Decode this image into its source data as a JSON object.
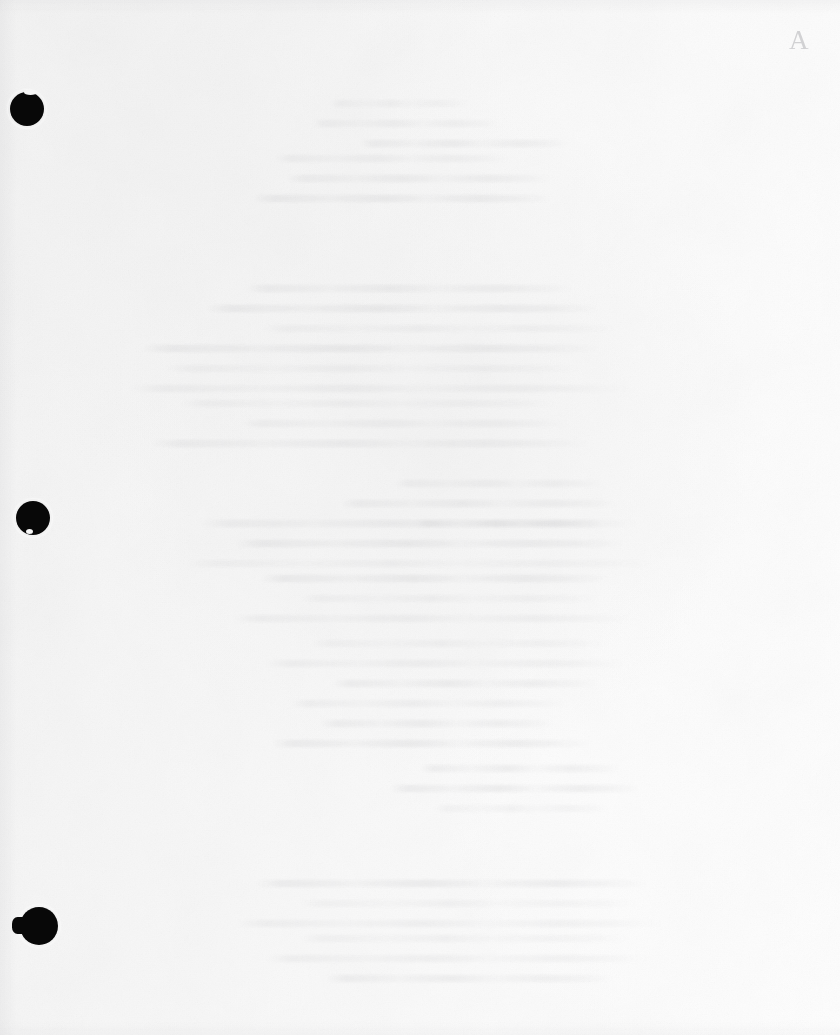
{
  "document": {
    "page_kind": "blank-scanned-page",
    "visible_text": "",
    "annotation": {
      "mark": "A",
      "description": "faint handwritten pencil mark, upper right corner"
    },
    "paper": {
      "background_color": "#f8f8f8",
      "tone_light": "#fefefe",
      "tone_mid": "#f8f8f8",
      "tone_dark": "#f3f3f3",
      "ink_color": "#080808"
    },
    "binding": {
      "description": "three-hole punch along left margin",
      "holes": [
        {
          "name": "top-punch-hole",
          "cx": 27,
          "cy": 109,
          "r": 17
        },
        {
          "name": "middle-punch-hole",
          "cx": 33,
          "cy": 518,
          "r": 17
        },
        {
          "name": "bottom-punch-hole",
          "cx": 39,
          "cy": 926,
          "r": 19
        }
      ]
    },
    "show_through": {
      "description": "faint ghost text bleeding through from the reverse side",
      "opacity": 0.55,
      "blocks": [
        {
          "top": 100,
          "left": 330,
          "lines": [
            [
              0,
              140
            ],
            [
              -18,
              190
            ],
            [
              30,
              210
            ]
          ]
        },
        {
          "top": 155,
          "left": 275,
          "lines": [
            [
              0,
              235
            ],
            [
              12,
              265
            ],
            [
              -22,
              300
            ]
          ]
        },
        {
          "top": 285,
          "left": 245,
          "lines": [
            [
              0,
              330
            ],
            [
              -40,
              395
            ],
            [
              18,
              355
            ]
          ]
        },
        {
          "top": 345,
          "left": 140,
          "lines": [
            [
              0,
              460
            ],
            [
              24,
              420
            ],
            [
              -10,
              500
            ]
          ]
        },
        {
          "top": 400,
          "left": 180,
          "lines": [
            [
              0,
              380
            ],
            [
              60,
              330
            ],
            [
              -30,
              440
            ]
          ]
        },
        {
          "top": 480,
          "left": 395,
          "lines": [
            [
              0,
              210
            ],
            [
              -55,
              280
            ],
            [
              20,
              185
            ]
          ]
        },
        {
          "top": 520,
          "left": 200,
          "lines": [
            [
              0,
              440
            ],
            [
              35,
              390
            ],
            [
              -15,
              470
            ]
          ]
        },
        {
          "top": 575,
          "left": 260,
          "lines": [
            [
              0,
              350
            ],
            [
              40,
              300
            ],
            [
              -28,
              400
            ]
          ]
        },
        {
          "top": 640,
          "left": 310,
          "lines": [
            [
              0,
              300
            ],
            [
              -45,
              360
            ],
            [
              22,
              265
            ]
          ]
        },
        {
          "top": 700,
          "left": 290,
          "lines": [
            [
              0,
              280
            ],
            [
              30,
              235
            ],
            [
              -18,
              320
            ]
          ]
        },
        {
          "top": 765,
          "left": 420,
          "lines": [
            [
              0,
              200
            ],
            [
              -30,
              250
            ],
            [
              15,
              175
            ]
          ]
        },
        {
          "top": 880,
          "left": 255,
          "lines": [
            [
              0,
              395
            ],
            [
              45,
              340
            ],
            [
              -20,
              430
            ]
          ]
        },
        {
          "top": 935,
          "left": 300,
          "lines": [
            [
              0,
              330
            ],
            [
              -35,
              385
            ],
            [
              25,
              290
            ]
          ]
        }
      ]
    }
  }
}
